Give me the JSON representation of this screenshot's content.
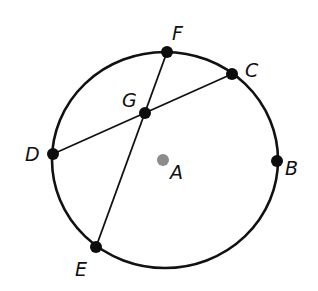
{
  "diagram": {
    "type": "circle-with-chords",
    "colors": {
      "stroke": "#111111",
      "point": "#0d0d0d",
      "center_point": "#8c8c8c",
      "background": "#ffffff"
    },
    "circle": {
      "center": "A",
      "cx": 165,
      "cy": 160,
      "rx": 113,
      "ry": 108
    },
    "points": [
      {
        "name": "F",
        "label": "F",
        "x": 167,
        "y": 52,
        "lx": 174,
        "ly": 40
      },
      {
        "name": "C",
        "label": "C",
        "x": 232,
        "y": 74,
        "lx": 246,
        "ly": 76
      },
      {
        "name": "G",
        "label": "G",
        "x": 145,
        "y": 113,
        "lx": 123,
        "ly": 106
      },
      {
        "name": "D",
        "label": "D",
        "x": 53,
        "y": 154,
        "lx": 26,
        "ly": 161
      },
      {
        "name": "B",
        "label": "B",
        "x": 277,
        "y": 161,
        "lx": 286,
        "ly": 175
      },
      {
        "name": "E",
        "label": "E",
        "x": 96,
        "y": 247,
        "lx": 76,
        "ly": 275
      },
      {
        "name": "A",
        "label": "A",
        "x": 163,
        "y": 160,
        "lx": 171,
        "ly": 178
      }
    ],
    "chords": [
      {
        "name": "FE",
        "from": "F",
        "to": "E"
      },
      {
        "name": "DC",
        "from": "D",
        "to": "C"
      }
    ],
    "labels": {
      "F": "F",
      "C": "C",
      "G": "G",
      "D": "D",
      "B": "B",
      "E": "E",
      "A": "A"
    }
  }
}
